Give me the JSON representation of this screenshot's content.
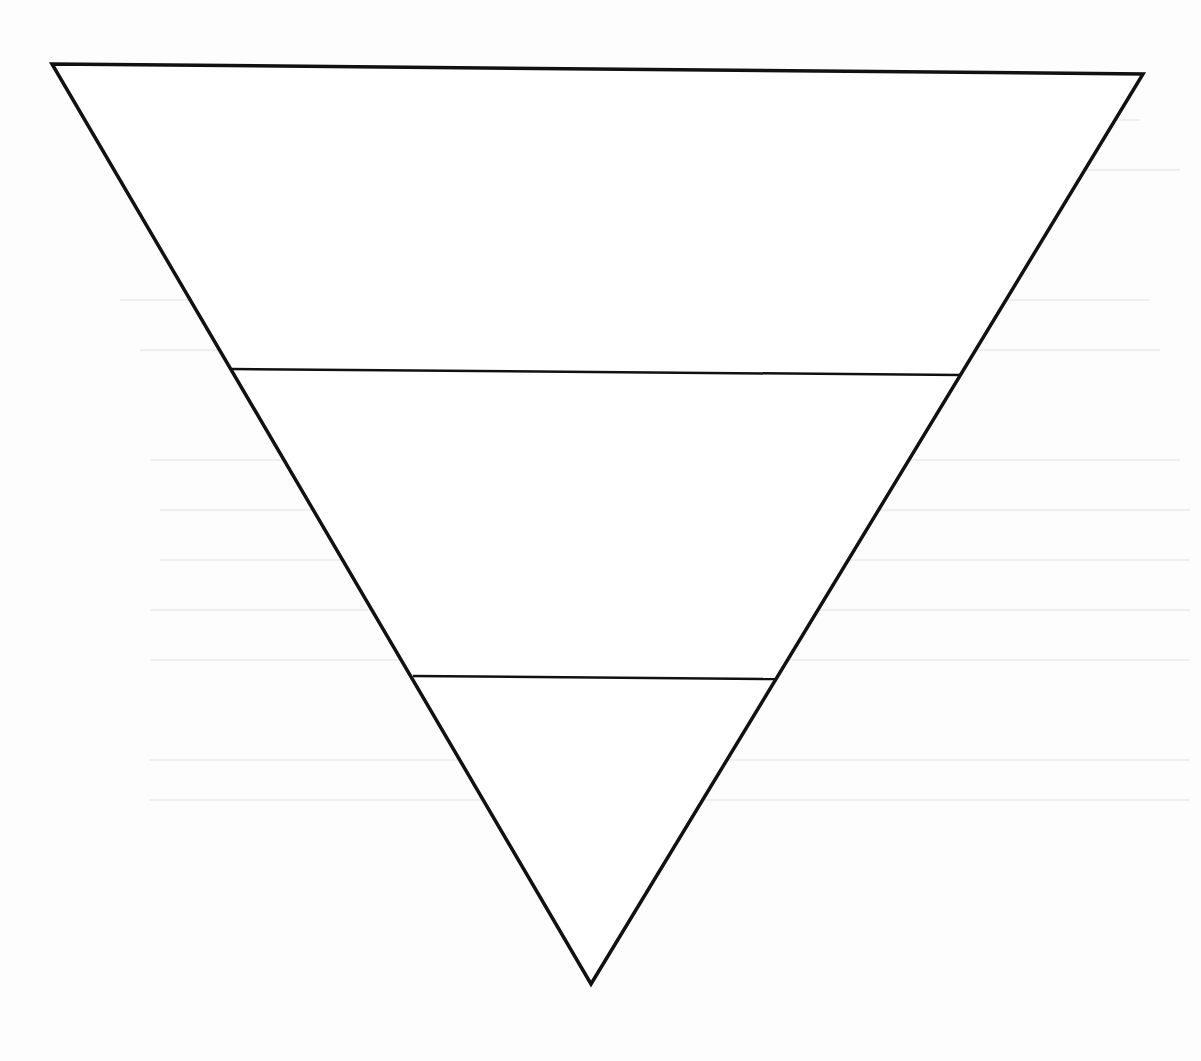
{
  "diagram": {
    "type": "inverted-triangle",
    "stroke_color": "#111111",
    "background_color": "#fdfdfd",
    "outline": {
      "top_left": [
        52,
        64
      ],
      "top_right": [
        1143,
        74
      ],
      "apex": [
        591,
        984
      ]
    },
    "dividers": [
      {
        "from": [
          232,
          369
        ],
        "to": [
          960,
          375
        ]
      },
      {
        "from": [
          413,
          676
        ],
        "to": [
          775,
          679
        ]
      }
    ],
    "tiers": [
      {
        "label": ""
      },
      {
        "label": ""
      },
      {
        "label": ""
      }
    ]
  }
}
